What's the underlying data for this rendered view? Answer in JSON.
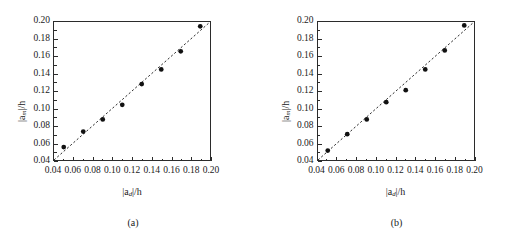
{
  "figure": {
    "panels": [
      {
        "caption": "(a)",
        "xlabel_num": "|a",
        "xlabel_sub": "d",
        "xlabel_tail": "|/h",
        "ylabel_num": "|a",
        "ylabel_sub": "m",
        "ylabel_tail": "|/h"
      },
      {
        "caption": "(b)",
        "xlabel_num": "|a",
        "xlabel_sub": "d",
        "xlabel_tail": "|/h",
        "ylabel_num": "|a",
        "ylabel_sub": "m",
        "ylabel_tail": "|/h"
      }
    ]
  },
  "chart_data": [
    {
      "type": "scatter",
      "title": "(a)",
      "xlabel": "|a_d|/h",
      "ylabel": "|a_m|/h",
      "xlim": [
        0.04,
        0.2
      ],
      "ylim": [
        0.04,
        0.2
      ],
      "xticks": [
        0.04,
        0.06,
        0.08,
        0.1,
        0.12,
        0.14,
        0.16,
        0.18,
        0.2
      ],
      "yticks": [
        0.04,
        0.06,
        0.08,
        0.1,
        0.12,
        0.14,
        0.16,
        0.18,
        0.2
      ],
      "xticklabels": [
        "0.04",
        "0.06",
        "0.08",
        "0.10",
        "0.12",
        "0.14",
        "0.16",
        "0.18",
        "0.20"
      ],
      "yticklabels": [
        "0.04",
        "0.06",
        "0.08",
        "0.10",
        "0.12",
        "0.14",
        "0.16",
        "0.18",
        "0.20"
      ],
      "grid": false,
      "legend": "none",
      "series": [
        {
          "name": "measured vs design amplitude",
          "marker": "filled-circle",
          "color": "#111111",
          "x": [
            0.05,
            0.07,
            0.09,
            0.11,
            0.13,
            0.15,
            0.17,
            0.19
          ],
          "y": [
            0.055,
            0.073,
            0.087,
            0.104,
            0.128,
            0.145,
            0.166,
            0.195
          ]
        },
        {
          "name": "1:1 reference line",
          "type": "line",
          "style": "dashed",
          "color": "#111111",
          "x": [
            0.04,
            0.2
          ],
          "y": [
            0.04,
            0.2
          ]
        }
      ]
    },
    {
      "type": "scatter",
      "title": "(b)",
      "xlabel": "|a_d|/h",
      "ylabel": "|a_m|/h",
      "xlim": [
        0.04,
        0.2
      ],
      "ylim": [
        0.04,
        0.2
      ],
      "xticks": [
        0.04,
        0.06,
        0.08,
        0.1,
        0.12,
        0.14,
        0.16,
        0.18,
        0.2
      ],
      "yticks": [
        0.04,
        0.06,
        0.08,
        0.1,
        0.12,
        0.14,
        0.16,
        0.18,
        0.2
      ],
      "xticklabels": [
        "0.04",
        "0.06",
        "0.08",
        "0.10",
        "0.12",
        "0.14",
        "0.16",
        "0.18",
        "0.20"
      ],
      "yticklabels": [
        "0.04",
        "0.06",
        "0.08",
        "0.10",
        "0.12",
        "0.14",
        "0.16",
        "0.18",
        "0.20"
      ],
      "grid": false,
      "legend": "none",
      "series": [
        {
          "name": "measured vs design amplitude",
          "marker": "filled-circle",
          "color": "#111111",
          "x": [
            0.05,
            0.07,
            0.09,
            0.11,
            0.13,
            0.15,
            0.17,
            0.19
          ],
          "y": [
            0.051,
            0.07,
            0.087,
            0.107,
            0.121,
            0.145,
            0.167,
            0.196
          ]
        },
        {
          "name": "1:1 reference line",
          "type": "line",
          "style": "dashed",
          "color": "#111111",
          "x": [
            0.04,
            0.2
          ],
          "y": [
            0.04,
            0.2
          ]
        }
      ]
    }
  ]
}
